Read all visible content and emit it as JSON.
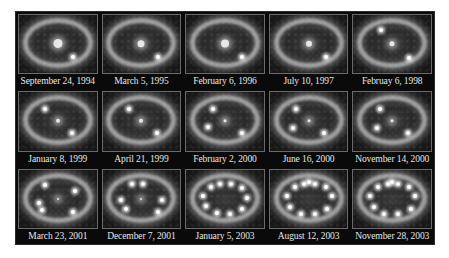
{
  "figure": {
    "grid": {
      "rows": 3,
      "columns": 5
    },
    "panels": [
      {
        "label": "September 24, 1994",
        "core_size": 9,
        "spots": [
          [
            70,
            72
          ]
        ]
      },
      {
        "label": "March 5, 1995",
        "core_size": 7,
        "spots": [
          [
            72,
            72
          ]
        ]
      },
      {
        "label": "February 6, 1996",
        "core_size": 8,
        "spots": [
          [
            72,
            72
          ]
        ]
      },
      {
        "label": "July 10, 1997",
        "core_size": 6,
        "spots": [
          [
            72,
            72
          ]
        ]
      },
      {
        "label": "Februay 6, 1998",
        "core_size": 5,
        "spots": [
          [
            72,
            74
          ],
          [
            35,
            25
          ]
        ]
      },
      {
        "label": "January 8, 1999",
        "core_size": 4,
        "spots": [
          [
            68,
            70
          ],
          [
            34,
            28
          ]
        ]
      },
      {
        "label": "April 21, 1999",
        "core_size": 4,
        "spots": [
          [
            70,
            70
          ],
          [
            34,
            28
          ]
        ]
      },
      {
        "label": "February 2, 2000",
        "core_size": 3,
        "spots": [
          [
            72,
            70
          ],
          [
            34,
            28
          ],
          [
            28,
            60
          ]
        ]
      },
      {
        "label": "June 16, 2000",
        "core_size": 3,
        "spots": [
          [
            70,
            70
          ],
          [
            34,
            28
          ],
          [
            30,
            62
          ]
        ]
      },
      {
        "label": "November 14, 2000",
        "core_size": 3,
        "spots": [
          [
            70,
            70
          ],
          [
            34,
            28
          ],
          [
            30,
            62
          ]
        ]
      },
      {
        "label": "March 23, 2001",
        "core_size": 2,
        "spots": [
          [
            70,
            72
          ],
          [
            34,
            26
          ],
          [
            26,
            58
          ],
          [
            30,
            70
          ],
          [
            72,
            36
          ]
        ]
      },
      {
        "label": "December 7, 2001",
        "core_size": 2,
        "spots": [
          [
            72,
            72
          ],
          [
            38,
            24
          ],
          [
            52,
            24
          ],
          [
            24,
            52
          ],
          [
            30,
            68
          ],
          [
            76,
            52
          ]
        ]
      },
      {
        "label": "January 5, 2003",
        "core_size": 0,
        "spots": [
          [
            32,
            30
          ],
          [
            44,
            24
          ],
          [
            58,
            24
          ],
          [
            72,
            32
          ],
          [
            78,
            48
          ],
          [
            72,
            68
          ],
          [
            56,
            76
          ],
          [
            40,
            74
          ],
          [
            26,
            62
          ],
          [
            22,
            46
          ]
        ]
      },
      {
        "label": "August 12, 2003",
        "core_size": 0,
        "spots": [
          [
            32,
            30
          ],
          [
            44,
            24
          ],
          [
            58,
            24
          ],
          [
            72,
            30
          ],
          [
            80,
            46
          ],
          [
            74,
            68
          ],
          [
            58,
            76
          ],
          [
            40,
            76
          ],
          [
            26,
            64
          ],
          [
            22,
            46
          ],
          [
            50,
            22
          ]
        ]
      },
      {
        "label": "November 28, 2003",
        "core_size": 0,
        "spots": [
          [
            32,
            30
          ],
          [
            44,
            24
          ],
          [
            58,
            24
          ],
          [
            72,
            30
          ],
          [
            80,
            46
          ],
          [
            74,
            68
          ],
          [
            58,
            76
          ],
          [
            40,
            76
          ],
          [
            26,
            64
          ],
          [
            22,
            46
          ],
          [
            50,
            22
          ]
        ]
      }
    ]
  }
}
